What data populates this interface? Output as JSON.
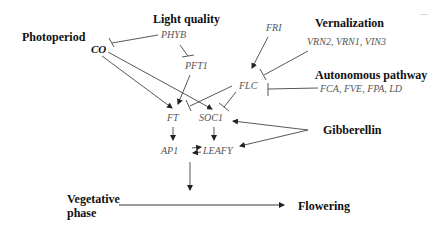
{
  "diagram": {
    "pathways": {
      "photoperiod": "Photoperiod",
      "light_quality": "Light quality",
      "vernalization": "Vernalization",
      "autonomous": "Autonomous pathway",
      "gibberellin": "Gibberellin"
    },
    "genes": {
      "co": "CO",
      "phyb": "PHYB",
      "pft1": "PFT1",
      "fri": "FRI",
      "vrn": "VRN2, VRN1, VIN3",
      "flc": "FLC",
      "autonomous_genes": "FCA, FVE, FPA, LD",
      "ft": "FT",
      "soc1": "SOC1",
      "ap1": "AP1",
      "leafy": "LEAFY"
    },
    "phases": {
      "vegetative_line1": "Vegetative",
      "vegetative_line2": "phase",
      "flowering": "Flowering"
    },
    "edges": [
      {
        "from": "PHYB",
        "to": "CO",
        "type": "inhibit"
      },
      {
        "from": "PHYB",
        "to": "PFT1",
        "type": "inhibit"
      },
      {
        "from": "CO",
        "to": "FT",
        "type": "activate"
      },
      {
        "from": "CO",
        "to": "SOC1",
        "type": "activate"
      },
      {
        "from": "PFT1",
        "to": "FT",
        "type": "activate"
      },
      {
        "from": "FRI",
        "to": "FLC",
        "type": "activate"
      },
      {
        "from": "VRN2, VRN1, VIN3",
        "to": "FLC",
        "type": "inhibit"
      },
      {
        "from": "FCA, FVE, FPA, LD",
        "to": "FLC",
        "type": "inhibit"
      },
      {
        "from": "FLC",
        "to": "FT",
        "type": "inhibit"
      },
      {
        "from": "FLC",
        "to": "SOC1",
        "type": "inhibit"
      },
      {
        "from": "Gibberellin",
        "to": "SOC1",
        "type": "activate"
      },
      {
        "from": "Gibberellin",
        "to": "LEAFY",
        "type": "activate"
      },
      {
        "from": "FT",
        "to": "AP1",
        "type": "activate"
      },
      {
        "from": "SOC1",
        "to": "LEAFY",
        "type": "activate"
      },
      {
        "from": "AP1",
        "to": "LEAFY",
        "type": "mutual-activate"
      },
      {
        "from": "AP1/LEAFY",
        "to": "Vegetative→Flowering",
        "type": "activate"
      },
      {
        "from": "Vegetative phase",
        "to": "Flowering",
        "type": "activate"
      }
    ]
  }
}
